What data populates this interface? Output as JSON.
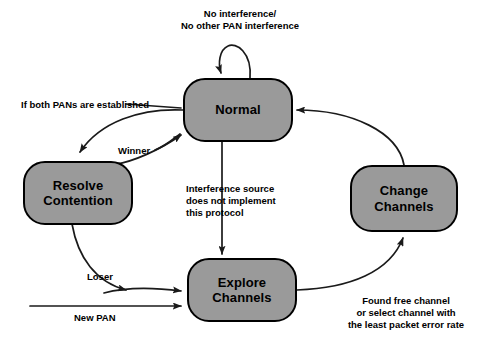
{
  "diagram": {
    "background_color": "#ffffff",
    "node_fill_color": "#9a9a9a",
    "node_border_color": "#000000",
    "text_color": "#000000",
    "states": [
      {
        "id": "normal",
        "label": "Normal"
      },
      {
        "id": "resolve_contention",
        "label": "Resolve\nContention"
      },
      {
        "id": "change_channels",
        "label": "Change\nChannels"
      },
      {
        "id": "explore_channels",
        "label": "Explore\nChannels"
      }
    ],
    "transitions": [
      {
        "id": "normal_self_loop",
        "from": "normal",
        "to": "normal",
        "label": "No interference/\nNo other PAN interference"
      },
      {
        "id": "normal_to_resolve",
        "from": "normal",
        "to": "resolve_contention",
        "label": "If both PANs are established"
      },
      {
        "id": "resolve_to_normal",
        "from": "resolve_contention",
        "to": "normal",
        "label": "Winner"
      },
      {
        "id": "normal_to_explore",
        "from": "normal",
        "to": "explore_channels",
        "label": "Interference source\ndoes not implement\nthis protocol"
      },
      {
        "id": "resolve_to_explore",
        "from": "resolve_contention",
        "to": "explore_channels",
        "label": "Loser"
      },
      {
        "id": "entry_to_explore",
        "from": "",
        "to": "explore_channels",
        "label": "New PAN"
      },
      {
        "id": "explore_to_change",
        "from": "explore_channels",
        "to": "change_channels",
        "label": "Found free channel\nor select channel with\nthe least packet error rate"
      },
      {
        "id": "change_to_normal",
        "from": "change_channels",
        "to": "normal",
        "label": ""
      }
    ]
  }
}
